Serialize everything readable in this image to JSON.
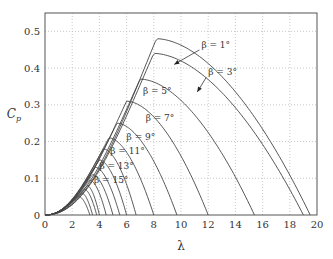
{
  "chart_data": {
    "type": "line",
    "title": "",
    "xlabel": "λ",
    "ylabel": "C_p",
    "xlim": [
      0,
      20
    ],
    "ylim": [
      0,
      0.55
    ],
    "xticks": [
      0,
      2,
      4,
      6,
      8,
      10,
      12,
      14,
      16,
      18,
      20
    ],
    "yticks": [
      0,
      0.1,
      0.2,
      0.3,
      0.4,
      0.5
    ],
    "xtick_labels": [
      "0",
      "2",
      "4",
      "6",
      "8",
      "10",
      "12",
      "14",
      "16",
      "18",
      "20"
    ],
    "ytick_labels": [
      "0",
      "0.1",
      "0.2",
      "0.3",
      "0.4",
      "0.5"
    ],
    "grid": true,
    "legend": "none (inline annotations)",
    "series": [
      {
        "name": "β = 1°",
        "beta": 1,
        "peak_cp": 0.48,
        "peak_lambda": 8.2,
        "zero_lambda": 19.5,
        "labeled": true
      },
      {
        "name": "β = 3°",
        "beta": 3,
        "peak_cp": 0.44,
        "peak_lambda": 8.0,
        "zero_lambda": 19.0,
        "labeled": true
      },
      {
        "name": "β = 5°",
        "beta": 5,
        "peak_cp": 0.37,
        "peak_lambda": 7.0,
        "zero_lambda": 15.4,
        "labeled": true
      },
      {
        "name": "β = 7°",
        "beta": 7,
        "peak_cp": 0.31,
        "peak_lambda": 6.0,
        "zero_lambda": 12.0,
        "labeled": true
      },
      {
        "name": "β = 9°",
        "beta": 9,
        "peak_cp": 0.25,
        "peak_lambda": 5.3,
        "zero_lambda": 9.7,
        "labeled": true
      },
      {
        "name": "β = 11°",
        "beta": 11,
        "peak_cp": 0.21,
        "peak_lambda": 4.7,
        "zero_lambda": 8.0,
        "labeled": true
      },
      {
        "name": "β = 13°",
        "beta": 13,
        "peak_cp": 0.18,
        "peak_lambda": 4.3,
        "zero_lambda": 6.7,
        "labeled": true
      },
      {
        "name": "β = 15°",
        "beta": 15,
        "peak_cp": 0.15,
        "peak_lambda": 4.0,
        "zero_lambda": 6.0,
        "labeled": true
      },
      {
        "name": "β = 17°",
        "beta": 17,
        "peak_cp": 0.13,
        "peak_lambda": 3.7,
        "zero_lambda": 5.5,
        "labeled": false
      },
      {
        "name": "β = 19°",
        "beta": 19,
        "peak_cp": 0.11,
        "peak_lambda": 3.5,
        "zero_lambda": 5.0,
        "labeled": false
      },
      {
        "name": "β = 21°",
        "beta": 21,
        "peak_cp": 0.095,
        "peak_lambda": 3.3,
        "zero_lambda": 4.5,
        "labeled": false
      },
      {
        "name": "β = 23°",
        "beta": 23,
        "peak_cp": 0.08,
        "peak_lambda": 3.1,
        "zero_lambda": 4.0,
        "labeled": false
      },
      {
        "name": "β = 25°",
        "beta": 25,
        "peak_cp": 0.07,
        "peak_lambda": 2.9,
        "zero_lambda": 3.8,
        "labeled": false
      },
      {
        "name": "β = 27°",
        "beta": 27,
        "peak_cp": 0.06,
        "peak_lambda": 2.7,
        "zero_lambda": 3.5,
        "labeled": false
      },
      {
        "name": "β = 29°",
        "beta": 29,
        "peak_cp": 0.05,
        "peak_lambda": 2.5,
        "zero_lambda": 3.3,
        "labeled": false
      }
    ],
    "annotations": [
      {
        "text": "β = 1°",
        "x": 11.5,
        "y": 0.455,
        "arrow_to": [
          9.5,
          0.41
        ]
      },
      {
        "text": "β = 3°",
        "x": 12.0,
        "y": 0.38,
        "arrow_to": [
          11.2,
          0.335
        ]
      },
      {
        "text": "β = 5°",
        "x": 7.2,
        "y": 0.33
      },
      {
        "text": "β = 7°",
        "x": 7.4,
        "y": 0.255
      },
      {
        "text": "β = 9°",
        "x": 6.0,
        "y": 0.205
      },
      {
        "text": "β = 11°",
        "x": 4.8,
        "y": 0.165
      },
      {
        "text": "β = 13°",
        "x": 4.0,
        "y": 0.125
      },
      {
        "text": "β = 15°",
        "x": 3.6,
        "y": 0.088
      }
    ]
  },
  "axes": {
    "xlabel": "λ",
    "ylabel": "C",
    "ylabel_sub": "p"
  },
  "colors": {
    "line": "#444444",
    "axis": "#555555",
    "grid": "#bbbbbb"
  }
}
